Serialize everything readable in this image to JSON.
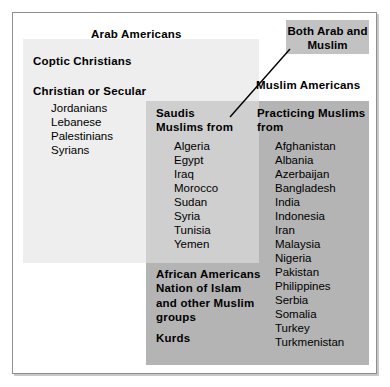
{
  "diagram": {
    "colors": {
      "arab_set_fill": "#eeeeee",
      "muslim_set_fill": "#b4b4b4",
      "intersection_fill": "#cfcfcf",
      "callout_fill": "#c2c2c2",
      "frame_border": "#8e8e8e",
      "text": "#000000"
    },
    "arab_set": {
      "title": "Arab Americans",
      "coptic_heading": "Coptic Christians",
      "christian_heading": "Christian or Secular",
      "christian_list": [
        "Jordanians",
        "Lebanese",
        "Palestinians",
        "Syrians"
      ]
    },
    "muslim_set": {
      "title": "Muslim Americans",
      "practicing_heading": "Practicing Muslims\nfrom",
      "practicing_list": [
        "Afghanistan",
        "Albania",
        "Azerbaijan",
        "Bangladesh",
        "India",
        "Indonesia",
        "Iran",
        "Malaysia",
        "Nigeria",
        "Pakistan",
        "Philippines",
        "Serbia",
        "Somalia",
        "Turkey",
        "Turkmenistan"
      ],
      "african_block": "African Americans\nNation of Islam\nand other Muslim\ngroups",
      "kurds_block": "Kurds"
    },
    "intersection": {
      "heading": "Saudis\nMuslims from",
      "list": [
        "Algeria",
        "Egypt",
        "Iraq",
        "Morocco",
        "Sudan",
        "Syria",
        "Tunisia",
        "Yemen"
      ]
    },
    "callout": {
      "label": "Both Arab\nand Muslim"
    }
  }
}
